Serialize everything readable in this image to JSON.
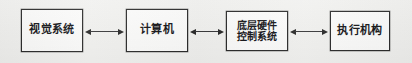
{
  "diagram": {
    "type": "block-flow-diagram",
    "orientation": "horizontal",
    "background_color": "#f1f1ef",
    "border_color": "#2b2b2b",
    "node_fill_color": "#fbfbfa",
    "text_color": "#17171a",
    "nodes": [
      {
        "id": "vision-system",
        "label": "视觉系统",
        "lines": [
          "视觉系统"
        ],
        "x": 21,
        "y": 9,
        "width": 62,
        "height": 43,
        "font_size": "11px"
      },
      {
        "id": "computer",
        "label": "计算机",
        "lines": [
          "计算机"
        ],
        "x": 126,
        "y": 9,
        "width": 62,
        "height": 43,
        "font_size": "11px"
      },
      {
        "id": "low-level-hardware-control-system",
        "label": "底层硬件控制系统",
        "lines": [
          "底层硬件",
          "控制系统"
        ],
        "x": 226,
        "y": 11,
        "width": 62,
        "height": 40,
        "font_size": "10px"
      },
      {
        "id": "actuator",
        "label": "执行机构",
        "lines": [
          "执行机构"
        ],
        "x": 330,
        "y": 11,
        "width": 60,
        "height": 40,
        "font_size": "11px"
      }
    ],
    "connectors": [
      {
        "id": "vision-to-computer",
        "from": "vision-system",
        "to": "computer",
        "direction": "bidirectional",
        "x": 85,
        "y": 27,
        "width": 39
      },
      {
        "id": "computer-to-hardware-control",
        "from": "computer",
        "to": "low-level-hardware-control-system",
        "direction": "bidirectional",
        "x": 190,
        "y": 27,
        "width": 34
      },
      {
        "id": "hardware-control-to-actuator",
        "from": "low-level-hardware-control-system",
        "to": "actuator",
        "direction": "bidirectional",
        "x": 290,
        "y": 27,
        "width": 38
      }
    ]
  }
}
